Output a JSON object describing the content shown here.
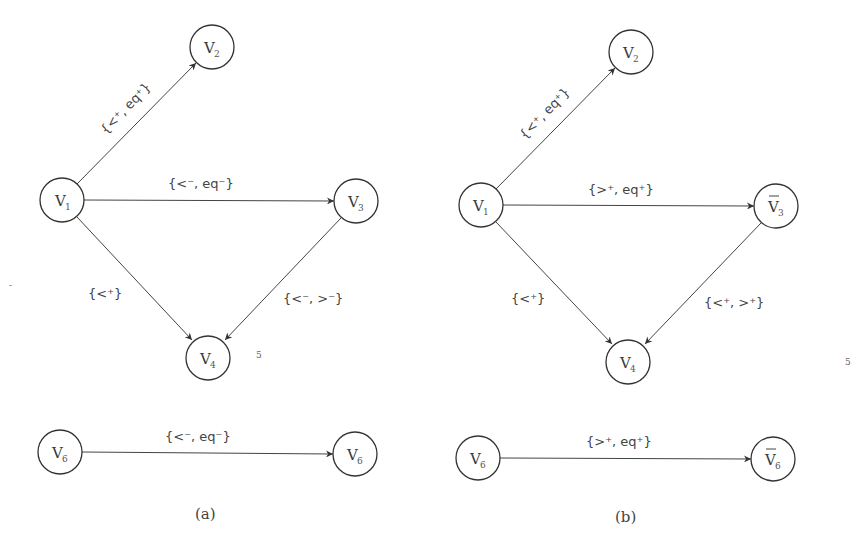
{
  "panels": [
    {
      "id": "a",
      "caption": "(a)",
      "nodes": [
        {
          "id": "a-v1",
          "base": "V",
          "sub": "1",
          "bar": false,
          "x": 62,
          "y": 200
        },
        {
          "id": "a-v2",
          "base": "V",
          "sub": "2",
          "bar": false,
          "x": 212,
          "y": 47
        },
        {
          "id": "a-v3",
          "base": "V",
          "sub": "3",
          "bar": false,
          "x": 356,
          "y": 201
        },
        {
          "id": "a-v4",
          "base": "V",
          "sub": "4",
          "bar": false,
          "x": 208,
          "y": 358
        },
        {
          "id": "a-v6-left",
          "base": "V",
          "sub": "6",
          "bar": false,
          "x": 60,
          "y": 452
        },
        {
          "id": "a-v6-right",
          "base": "V",
          "sub": "6",
          "bar": false,
          "x": 355,
          "y": 454
        }
      ],
      "edges": [
        {
          "from": "a-v1",
          "to": "a-v2",
          "label": "{<⁺, eq⁺}",
          "parts": [
            [
              "{<",
              "+"
            ],
            [
              ", eq",
              "+"
            ],
            [
              "}",
              ""
            ]
          ]
        },
        {
          "from": "a-v1",
          "to": "a-v3",
          "label": "{<⁻, eq⁻}",
          "parts": [
            [
              "{<",
              "-"
            ],
            [
              ", eq",
              "-"
            ],
            [
              "}",
              ""
            ]
          ]
        },
        {
          "from": "a-v1",
          "to": "a-v4",
          "label": "{<⁺}",
          "parts": [
            [
              "{<",
              "+"
            ],
            [
              "}",
              ""
            ]
          ]
        },
        {
          "from": "a-v3",
          "to": "a-v4",
          "label": "{<⁻, >⁻}",
          "parts": [
            [
              "{<",
              "-"
            ],
            [
              ", >",
              "-"
            ],
            [
              "}",
              ""
            ]
          ]
        },
        {
          "from": "a-v6-left",
          "to": "a-v6-right",
          "label": "{<⁻, eq⁻}",
          "parts": [
            [
              "{<",
              "-"
            ],
            [
              ", eq",
              "-"
            ],
            [
              "}",
              ""
            ]
          ]
        }
      ],
      "side_marker": "5"
    },
    {
      "id": "b",
      "caption": "(b)",
      "nodes": [
        {
          "id": "b-v1",
          "base": "V",
          "sub": "1",
          "bar": false,
          "x": 481,
          "y": 205
        },
        {
          "id": "b-v2",
          "base": "V",
          "sub": "2",
          "bar": false,
          "x": 631,
          "y": 52
        },
        {
          "id": "b-v3bar",
          "base": "V",
          "sub": "3",
          "bar": true,
          "x": 776,
          "y": 206
        },
        {
          "id": "b-v4",
          "base": "V",
          "sub": "4",
          "bar": false,
          "x": 628,
          "y": 362
        },
        {
          "id": "b-v6-left",
          "base": "V",
          "sub": "6",
          "bar": false,
          "x": 478,
          "y": 458
        },
        {
          "id": "b-v6bar",
          "base": "V",
          "sub": "6",
          "bar": true,
          "x": 773,
          "y": 459
        }
      ],
      "edges": [
        {
          "from": "b-v1",
          "to": "b-v2",
          "label": "{<⁺, eq⁺}",
          "parts": [
            [
              "{<",
              "+"
            ],
            [
              ", eq",
              "+"
            ],
            [
              "}",
              ""
            ]
          ]
        },
        {
          "from": "b-v1",
          "to": "b-v3bar",
          "label": "{>⁺, eq⁺}",
          "parts": [
            [
              "{>",
              "+"
            ],
            [
              ", eq",
              "+"
            ],
            [
              "}",
              ""
            ]
          ]
        },
        {
          "from": "b-v1",
          "to": "b-v4",
          "label": "{<⁺}",
          "parts": [
            [
              "{<",
              "+"
            ],
            [
              "}",
              ""
            ]
          ]
        },
        {
          "from": "b-v3bar",
          "to": "b-v4",
          "label": "{<⁺, >⁺}",
          "parts": [
            [
              "{<",
              "+"
            ],
            [
              ", >",
              "+"
            ],
            [
              "}",
              ""
            ]
          ]
        },
        {
          "from": "b-v6-left",
          "to": "b-v6bar",
          "label": "{>⁺, eq⁺}",
          "parts": [
            [
              "{>",
              "+"
            ],
            [
              ", eq",
              "+"
            ],
            [
              "}",
              ""
            ]
          ]
        }
      ],
      "side_marker": "5"
    }
  ],
  "stray_mark": "-"
}
